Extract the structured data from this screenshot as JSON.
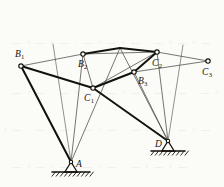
{
  "figure": {
    "type": "structural-mechanism-diagram",
    "background_color": "#fbfbf8",
    "ink_color": "#14120f",
    "thin_ink_color": "#4a4843"
  },
  "nodes": [
    {
      "id": "B1",
      "label": "B",
      "sub": "1",
      "x": 21,
      "y": 66,
      "label_x": 15,
      "label_y": 50,
      "joint": "open-circle"
    },
    {
      "id": "B2",
      "label": "B",
      "sub": "2",
      "x": 83,
      "y": 54,
      "label_x": 78,
      "label_y": 60,
      "joint": "open-circle"
    },
    {
      "id": "B3",
      "label": "B",
      "sub": "3",
      "x": 134,
      "y": 72,
      "label_x": 138,
      "label_y": 77,
      "joint": "open-circle"
    },
    {
      "id": "C1",
      "label": "C",
      "sub": "1",
      "x": 93,
      "y": 88,
      "label_x": 84,
      "label_y": 94,
      "joint": "open-circle"
    },
    {
      "id": "C2",
      "label": "C",
      "sub": "2",
      "x": 157,
      "y": 52,
      "label_x": 152,
      "label_y": 59,
      "joint": "open-circle"
    },
    {
      "id": "C3",
      "label": "C",
      "sub": "3",
      "x": 208,
      "y": 61,
      "label_x": 202,
      "label_y": 68,
      "joint": "open-circle"
    },
    {
      "id": "A",
      "label": "A",
      "sub": "",
      "x": 71,
      "y": 162,
      "label_x": 76,
      "label_y": 160,
      "joint": "pin-support"
    },
    {
      "id": "D",
      "label": "D",
      "sub": "",
      "x": 168,
      "y": 141,
      "label_x": 155,
      "label_y": 140,
      "joint": "pin-support"
    },
    {
      "id": "V",
      "label": "",
      "sub": "",
      "x": 120,
      "y": 48,
      "label_x": 0,
      "label_y": 0,
      "joint": "none"
    }
  ],
  "members_thick": [
    {
      "from": "B2",
      "to": "V",
      "note": "top chord left"
    },
    {
      "from": "V",
      "to": "C2",
      "note": "top chord right"
    },
    {
      "from": "C1",
      "to": "B3",
      "note": "mid chord"
    },
    {
      "from": "B3",
      "to": "C2",
      "note": "mid chord to C2"
    },
    {
      "from": "B1",
      "to": "C1",
      "note": "left upper diagonal"
    },
    {
      "from": "B1",
      "to": "A",
      "note": "left leg"
    },
    {
      "from": "C1",
      "to": "D",
      "note": "long diagonal to D"
    }
  ],
  "members_thin": [
    {
      "from": "B1",
      "to": "B2",
      "note": "upper left tie"
    },
    {
      "from": "B1",
      "to": "A",
      "note": "left leg companion"
    },
    {
      "from": "B2",
      "to": "A",
      "note": "B2 to A"
    },
    {
      "from": "B2",
      "to": "C1",
      "note": "B2 to C1"
    },
    {
      "from": "B2",
      "to": "C2",
      "note": "B2 to C2 long tie"
    },
    {
      "from": "C1",
      "to": "C2",
      "note": "C1 to C2"
    },
    {
      "from": "C2",
      "to": "C3",
      "note": "top right tie"
    },
    {
      "from": "B3",
      "to": "C3",
      "note": "B3 to C3"
    },
    {
      "from": "B3",
      "to": "D",
      "note": "B3 to D"
    },
    {
      "from": "C2",
      "to": "D",
      "note": "C2 to D"
    },
    {
      "from": "V",
      "to": "A",
      "note": "apex down to A"
    },
    {
      "from": "V",
      "to": "D",
      "note": "apex down to D"
    }
  ],
  "guide_lines": [
    {
      "x1": 53,
      "y1": 44,
      "x2": 71,
      "y2": 162,
      "note": "left extension line through A"
    },
    {
      "x1": 183,
      "y1": 45,
      "x2": 168,
      "y2": 141,
      "note": "right extension line through D"
    }
  ],
  "supports": [
    {
      "id": "A",
      "type": "pin",
      "x": 71,
      "y": 162,
      "ground_y": 172,
      "ground_half_width": 19,
      "hatch_count": 9
    },
    {
      "id": "D",
      "type": "pin",
      "x": 168,
      "y": 141,
      "ground_y": 151,
      "ground_half_width": 17,
      "hatch_count": 8
    }
  ],
  "background_bleed_text": [
    {
      "text": "· — ▫ — ▫ — · — ▫ — ▫ — · — ▫ — ▫ — ·",
      "x": 4,
      "y": 38
    },
    {
      "text": "· — ▫ — · — ▫ — · — ▫ — · — ▫ — · — ▫",
      "x": 4,
      "y": 88
    },
    {
      "text": "▫ — · — ▫ — · — ▫ — · — ▫ — · — ▫ — ·",
      "x": 4,
      "y": 125
    },
    {
      "text": "· — ▫ — ▫ — · — ▫ — · — ▫ — ▫ — ·",
      "x": 4,
      "y": 162
    }
  ]
}
